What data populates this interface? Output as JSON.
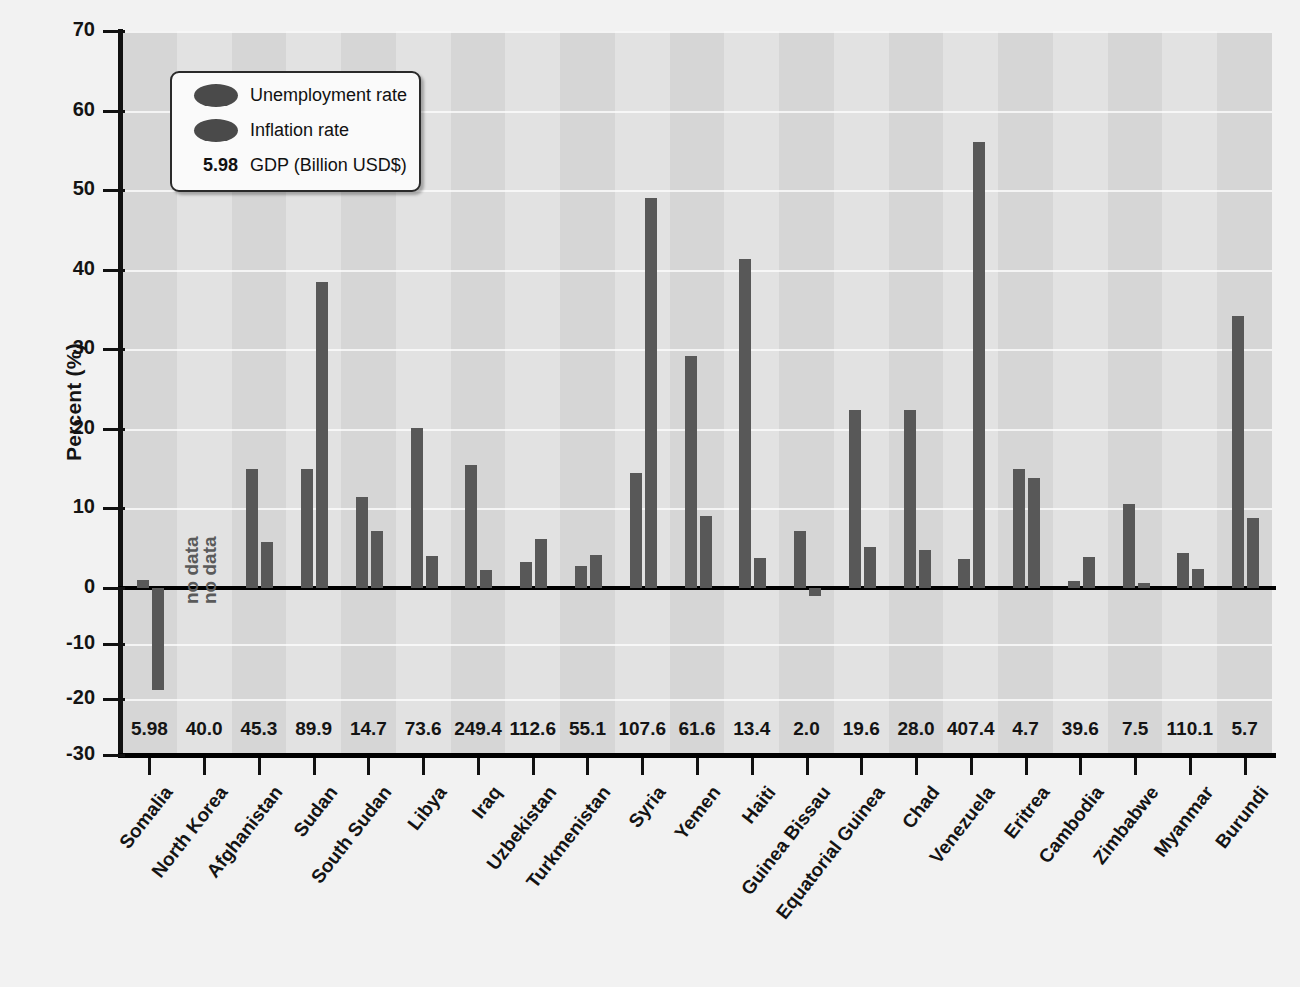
{
  "chart_data": {
    "type": "bar",
    "title": "",
    "xlabel": "",
    "ylabel": "Percent (%)",
    "ylim": [
      -30,
      70
    ],
    "yticks": [
      70,
      60,
      50,
      40,
      30,
      20,
      10,
      0,
      -10,
      -20,
      -30
    ],
    "grid": true,
    "legend_position": "top-left",
    "categories": [
      "Somalia",
      "North Korea",
      "Afghanistan",
      "Sudan",
      "South Sudan",
      "Libya",
      "Iraq",
      "Uzbekistan",
      "Turkmenistan",
      "Syria",
      "Yemen",
      "Haiti",
      "Guinea Bissau",
      "Equatorial Guinea",
      "Chad",
      "Venezuela",
      "Eritrea",
      "Cambodia",
      "Zimbabwe",
      "Myanmar",
      "Burundi"
    ],
    "series": [
      {
        "name": "Unemployment rate",
        "color": "#585858",
        "values": [
          1.0,
          null,
          15.0,
          15.0,
          11.4,
          20.1,
          15.5,
          3.3,
          2.8,
          14.5,
          29.2,
          41.3,
          7.2,
          22.4,
          22.4,
          3.6,
          14.9,
          0.9,
          10.5,
          4.4,
          34.2
        ]
      },
      {
        "name": "Inflation rate",
        "color": "#585858",
        "values": [
          -18.3,
          null,
          5.8,
          38.4,
          7.2,
          4.0,
          2.2,
          6.2,
          4.1,
          49.0,
          9.1,
          3.8,
          -1.5,
          5.1,
          4.8,
          56.1,
          13.8,
          3.9,
          0.6,
          2.4,
          8.8
        ]
      }
    ],
    "no_data_categories": [
      "North Korea"
    ],
    "no_data_text": "no data",
    "annotation_row": {
      "label": "GDP (Billion USD$)",
      "values": [
        "5.98",
        "40.0",
        "45.3",
        "89.9",
        "14.7",
        "73.6",
        "249.4",
        "112.6",
        "55.1",
        "107.6",
        "61.6",
        "13.4",
        "2.0",
        "19.6",
        "28.0",
        "407.4",
        "4.7",
        "39.6",
        "7.5",
        "110.1",
        "5.7"
      ]
    }
  },
  "legend": {
    "items": [
      {
        "kind": "swatch",
        "label": "Unemployment rate"
      },
      {
        "kind": "swatch",
        "label": "Inflation rate"
      },
      {
        "kind": "value",
        "value": "5.98",
        "label": "GDP (Billion USD$)"
      }
    ]
  },
  "axis": {
    "y_title": "Percent (%)"
  }
}
